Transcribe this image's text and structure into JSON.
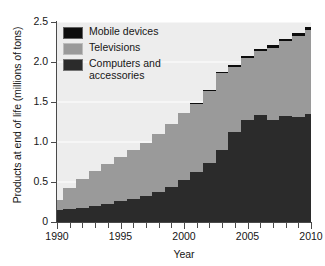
{
  "chart": {
    "type": "area",
    "ylabel": "Products at end of life (millions of tons)",
    "xlabel": "Year",
    "ylim": [
      0,
      2.5
    ],
    "xlim": [
      1990,
      2010
    ],
    "yticks": [
      "0",
      "0.5",
      "1.0",
      "1.5",
      "2.0",
      "2.5"
    ],
    "ytick_values": [
      0,
      0.5,
      1.0,
      1.5,
      2.0,
      2.5
    ],
    "xticks": [
      "1990",
      "1995",
      "2000",
      "2005",
      "2010"
    ],
    "xtick_values": [
      1990,
      1995,
      2000,
      2005,
      2010
    ],
    "xtick_minor": [
      1991,
      1992,
      1993,
      1994,
      1996,
      1997,
      1998,
      1999,
      2001,
      2002,
      2003,
      2004,
      2006,
      2007,
      2008,
      2009
    ],
    "grid": "horizontal",
    "plot_background": "#ededed",
    "stacked": true,
    "step": true
  },
  "legend": {
    "position": "upper-left",
    "items": [
      {
        "label": "Mobile devices",
        "color": "#0d0d0d"
      },
      {
        "label": "Televisions",
        "color": "#9a9a9a"
      },
      {
        "label": "Computers and\naccessories",
        "color": "#2b2b2b"
      }
    ]
  },
  "chart_data": {
    "type": "area",
    "title": "",
    "xlabel": "Year",
    "ylabel": "Products at end of life (millions of tons)",
    "ylim": [
      0,
      2.5
    ],
    "xlim": [
      1990,
      2010
    ],
    "grid": "horizontal",
    "legend_position": "upper-left",
    "stacked": true,
    "step": true,
    "x": [
      1990,
      1991,
      1992,
      1993,
      1994,
      1995,
      1996,
      1997,
      1998,
      1999,
      2000,
      2001,
      2002,
      2003,
      2004,
      2005,
      2006,
      2007,
      2008,
      2009,
      2010
    ],
    "series": [
      {
        "name": "Computers and accessories",
        "color": "#2b2b2b",
        "values": [
          0.15,
          0.16,
          0.18,
          0.2,
          0.23,
          0.26,
          0.29,
          0.33,
          0.38,
          0.44,
          0.52,
          0.62,
          0.74,
          0.9,
          1.13,
          1.27,
          1.34,
          1.28,
          1.33,
          1.31,
          1.35
        ]
      },
      {
        "name": "Televisions",
        "color": "#9a9a9a",
        "values": [
          0.13,
          0.26,
          0.36,
          0.44,
          0.5,
          0.55,
          0.61,
          0.66,
          0.72,
          0.78,
          0.84,
          0.86,
          0.9,
          0.96,
          0.81,
          0.78,
          0.8,
          0.9,
          0.93,
          1.01,
          1.05
        ]
      },
      {
        "name": "Mobile devices",
        "color": "#0d0d0d",
        "values": [
          0.0,
          0.0,
          0.0,
          0.0,
          0.0,
          0.0,
          0.0,
          0.0,
          0.0,
          0.0,
          0.0,
          0.01,
          0.01,
          0.01,
          0.02,
          0.02,
          0.02,
          0.03,
          0.03,
          0.04,
          0.04
        ]
      }
    ],
    "totals": [
      0.28,
      0.42,
      0.54,
      0.64,
      0.73,
      0.81,
      0.9,
      0.99,
      1.1,
      1.22,
      1.36,
      1.49,
      1.65,
      1.87,
      1.96,
      2.07,
      2.16,
      2.21,
      2.29,
      2.36,
      2.44
    ]
  }
}
